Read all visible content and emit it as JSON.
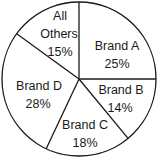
{
  "chart_data": {
    "type": "pie",
    "title": "",
    "start_angle": "12 o'clock",
    "direction": "clockwise",
    "categories": [
      "Brand A",
      "Brand B",
      "Brand C",
      "Brand D",
      "All Others"
    ],
    "values": [
      25,
      14,
      18,
      28,
      15
    ],
    "units": "%",
    "slices": [
      {
        "label": "Brand A",
        "value": 25,
        "pct_text": "25%"
      },
      {
        "label": "Brand B",
        "value": 14,
        "pct_text": "14%"
      },
      {
        "label": "Brand C",
        "value": 18,
        "pct_text": "18%"
      },
      {
        "label": "Brand D",
        "value": 28,
        "pct_text": "28%"
      },
      {
        "label": "All Others",
        "value": 15,
        "pct_text": "15%",
        "label_lines": [
          "All",
          "Others"
        ]
      }
    ],
    "fill": "#ffffff",
    "stroke": "#1a1a1a"
  }
}
